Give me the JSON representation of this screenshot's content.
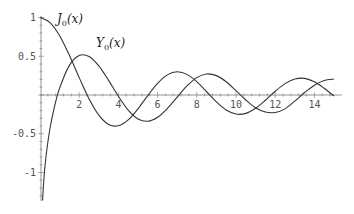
{
  "chart_data": {
    "type": "line",
    "title": "",
    "xlabel": "",
    "ylabel": "",
    "xlim": [
      0,
      15
    ],
    "ylim": [
      -1.35,
      1.0
    ],
    "grid": false,
    "legend": "inline labels",
    "x_ticks": [
      2,
      4,
      6,
      8,
      10,
      12,
      14
    ],
    "y_ticks": [
      1,
      0.5,
      -0.5,
      -1
    ],
    "x_tick_labels": [
      "2",
      "4",
      "6",
      "8",
      "10",
      "12",
      "14"
    ],
    "y_tick_labels": [
      "1",
      "0.5",
      "-0.5",
      "-1"
    ],
    "series": [
      {
        "name": "J0(x)",
        "label_main": "J",
        "label_sub": "0",
        "label_arg": "(x)",
        "x": [
          0,
          0.5,
          1,
          1.5,
          2,
          2.5,
          3,
          3.5,
          4,
          4.5,
          5,
          5.5,
          6,
          6.5,
          7,
          7.5,
          8,
          8.5,
          9,
          9.5,
          10,
          10.5,
          11,
          11.5,
          12,
          12.5,
          13,
          13.5,
          14,
          14.5,
          15
        ],
        "values": [
          1.0,
          0.938,
          0.765,
          0.512,
          0.224,
          -0.048,
          -0.26,
          -0.38,
          -0.397,
          -0.321,
          -0.178,
          -0.007,
          0.151,
          0.26,
          0.3,
          0.266,
          0.172,
          0.042,
          -0.09,
          -0.194,
          -0.246,
          -0.237,
          -0.171,
          -0.068,
          0.048,
          0.147,
          0.207,
          0.215,
          0.171,
          0.087,
          -0.014
        ]
      },
      {
        "name": "Y0(x)",
        "label_main": "Y",
        "label_sub": "0",
        "label_arg": "(x)",
        "x": [
          0.05,
          0.1,
          0.2,
          0.3,
          0.5,
          0.75,
          1,
          1.5,
          2,
          2.5,
          3,
          3.5,
          4,
          4.5,
          5,
          5.5,
          6,
          6.5,
          7,
          7.5,
          8,
          8.5,
          9,
          9.5,
          10,
          10.5,
          11,
          11.5,
          12,
          12.5,
          13,
          13.5,
          14,
          14.5,
          15
        ],
        "values": [
          -1.979,
          -1.534,
          -1.081,
          -0.807,
          -0.445,
          -0.137,
          0.088,
          0.382,
          0.51,
          0.498,
          0.377,
          0.189,
          -0.017,
          -0.195,
          -0.309,
          -0.339,
          -0.288,
          -0.173,
          -0.026,
          0.117,
          0.224,
          0.271,
          0.25,
          0.171,
          0.056,
          -0.064,
          -0.164,
          -0.22,
          -0.225,
          -0.179,
          -0.079,
          0.032,
          0.127,
          0.188,
          0.206
        ]
      }
    ],
    "colors": {
      "curve": "#333333",
      "axis": "#777777",
      "tick_text": "#555555"
    }
  }
}
